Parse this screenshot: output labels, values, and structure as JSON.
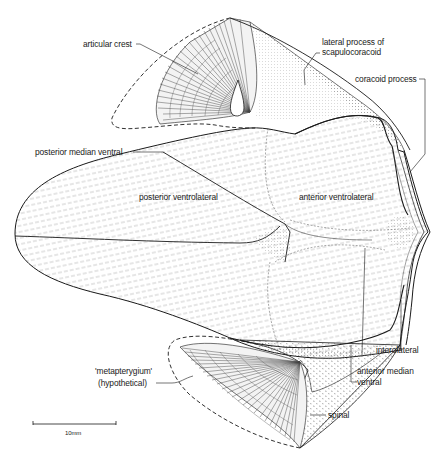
{
  "figure": {
    "title_strip": "(cropped heading, illegible)",
    "stroke_color": "#1a1a1a",
    "hatch_color": "#8a8a8a",
    "background": "#ffffff"
  },
  "labels": {
    "articular_crest": "articular crest",
    "lateral_process_line1": "lateral process of",
    "lateral_process_line2": "scapulocoracoid",
    "coracoid_process": "coracoid process",
    "posterior_median_ventral": "posterior median ventral",
    "posterior_ventrolateral": "posterior ventrolateral",
    "anterior_ventrolateral": "anterior ventrolateral",
    "interolateral": "interolateral",
    "anterior_median_line1": "anterior median",
    "anterior_median_line2": "ventral",
    "metapterygium_line1": "'metapterygium'",
    "metapterygium_line2": "(hypothetical)",
    "spinal": "spinal"
  },
  "scale_bar": {
    "label": "10mm",
    "length_px": 83
  }
}
